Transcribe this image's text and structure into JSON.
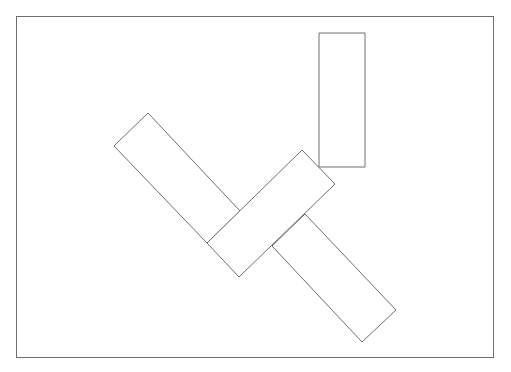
{
  "canvas": {
    "width": 511,
    "height": 372,
    "background": "#ffffff"
  },
  "stroke": {
    "color": "#6e6e6e",
    "width": 1
  },
  "frame": {
    "x": 16,
    "y": 16,
    "width": 477,
    "height": 341
  },
  "shapes": [
    {
      "name": "upright-rectangle",
      "points": "319,33 365,33 365,167 319,167"
    },
    {
      "name": "diagonal-rectangle-upper-left",
      "points": "148,113 240,211 207,243 114,146"
    },
    {
      "name": "diagonal-rectangle-middle",
      "points": "207,243 302,150 335,184 239,277"
    },
    {
      "name": "diagonal-rectangle-lower-right",
      "points": "305,214 396,310 362,342 272,246"
    }
  ]
}
